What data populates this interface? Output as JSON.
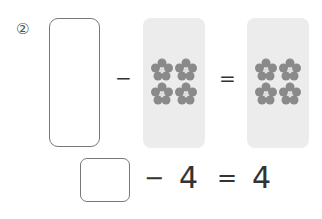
{
  "problem": {
    "number": "②",
    "picture_equation": {
      "operator_minus": "−",
      "operator_equals": "=",
      "left_box": "",
      "panel_1": {
        "count": 4,
        "item": "flower"
      },
      "panel_2": {
        "count": 4,
        "item": "flower"
      }
    },
    "number_equation": {
      "answer_box": "",
      "minus": "−",
      "subtrahend": "4",
      "equals": "=",
      "result": "4"
    }
  },
  "colors": {
    "panel_bg": "#ececec",
    "box_border": "#777777",
    "flower": "#8a8a8a"
  }
}
